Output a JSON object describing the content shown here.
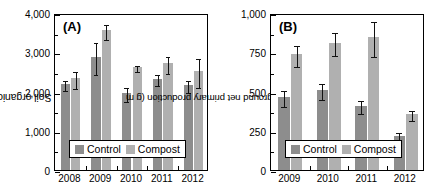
{
  "figure": {
    "background": "#ffffff",
    "panels": [
      "A",
      "B"
    ]
  },
  "colors": {
    "control": "#8d8d8d",
    "compost": "#b0b0b0",
    "axis": "#000000",
    "error_bar": "#111111"
  },
  "legend": {
    "control_label": "Control",
    "compost_label": "Compost"
  },
  "panel_a": {
    "label": "(A)",
    "ylabel_text": "Soil organic carbon (g m",
    "ylabel_sup": "-2",
    "ylabel_close": ")",
    "ytick_labels": [
      "0",
      "1,000",
      "2,000",
      "3,000",
      "4,000"
    ],
    "xtick_labels": [
      "2008",
      "2009",
      "2010",
      "2011",
      "2012"
    ]
  },
  "panel_b": {
    "label": "(B)",
    "ylabel_text": "Aboveground net primary production (g m",
    "ylabel_sup": "-2",
    "ylabel_close": ")",
    "ytick_labels": [
      "0",
      "250",
      "500",
      "750",
      "1,000"
    ],
    "xtick_labels": [
      "2009",
      "2010",
      "2011",
      "2012"
    ]
  },
  "chart_data": [
    {
      "type": "bar",
      "panel": "A",
      "title": "(A)",
      "xlabel": "",
      "ylabel": "Soil organic carbon (g m^-2)",
      "ylim": [
        0,
        4000
      ],
      "yticks": [
        0,
        1000,
        2000,
        3000,
        4000
      ],
      "ytick_labels": [
        "0",
        "1,000",
        "2,000",
        "3,000",
        "4,000"
      ],
      "minor_ticks": [
        500,
        1500,
        2500,
        3500
      ],
      "grid": false,
      "legend_position": "bottom-center-inside",
      "categories": [
        "2008",
        "2009",
        "2010",
        "2011",
        "2012"
      ],
      "series": [
        {
          "name": "Control",
          "color": "#8d8d8d",
          "values": [
            2200,
            2880,
            1960,
            2320,
            2170
          ],
          "errors": [
            130,
            400,
            180,
            140,
            150
          ]
        },
        {
          "name": "Compost",
          "color": "#b0b0b0",
          "values": [
            2340,
            3560,
            2630,
            2720,
            2510
          ],
          "errors": [
            215,
            190,
            80,
            220,
            370
          ]
        }
      ]
    },
    {
      "type": "bar",
      "panel": "B",
      "title": "(B)",
      "xlabel": "",
      "ylabel": "Aboveground net primary production (g m^-2)",
      "ylim": [
        0,
        1000
      ],
      "yticks": [
        0,
        250,
        500,
        750,
        1000
      ],
      "ytick_labels": [
        "0",
        "250",
        "500",
        "750",
        "1,000"
      ],
      "minor_ticks": [
        125,
        375,
        625,
        875
      ],
      "grid": false,
      "legend_position": "bottom-center-inside",
      "categories": [
        "2009",
        "2010",
        "2011",
        "2012"
      ],
      "series": [
        {
          "name": "Control",
          "color": "#8d8d8d",
          "values": [
            465,
            508,
            410,
            214
          ],
          "errors": [
            48,
            50,
            40,
            35
          ]
        },
        {
          "name": "Compost",
          "color": "#b0b0b0",
          "values": [
            736,
            812,
            845,
            355
          ],
          "errors": [
            65,
            72,
            112,
            32
          ]
        }
      ]
    }
  ]
}
